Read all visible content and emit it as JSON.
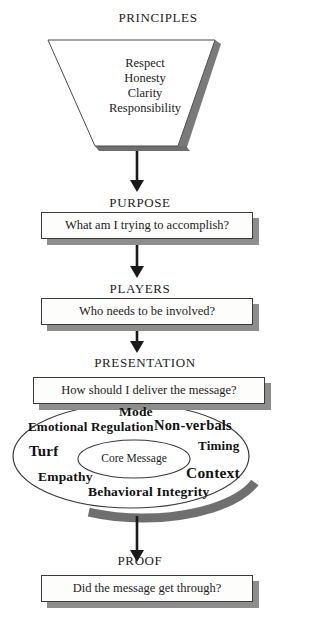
{
  "diagram": {
    "title_flow": "Communication planning funnel",
    "funnel": {
      "heading": "PRINCIPLES",
      "items": [
        "Respect",
        "Honesty",
        "Clarity",
        "Responsibility"
      ]
    },
    "stages": [
      {
        "heading": "PURPOSE",
        "question": "What am I trying to accomplish?"
      },
      {
        "heading": "PLAYERS",
        "question": "Who needs to be involved?"
      },
      {
        "heading": "PRESENTATION",
        "question": "How should I deliver the message?"
      },
      {
        "heading": "PROOF",
        "question": "Did the message get through?"
      }
    ],
    "oval": {
      "center_label": "Core Message",
      "terms": [
        "Mode",
        "Emotional Regulation",
        "Non-verbals",
        "Turf",
        "Timing",
        "Empathy",
        "Context",
        "Behavioral Integrity"
      ]
    },
    "colors": {
      "outline": "#3a3a3a",
      "shadow": "#8d8d8d",
      "shadow_dark": "#6f6f6f",
      "text": "#1c1c1c",
      "paper": "#ffffff",
      "box_fill": "#fdfdfb"
    }
  }
}
